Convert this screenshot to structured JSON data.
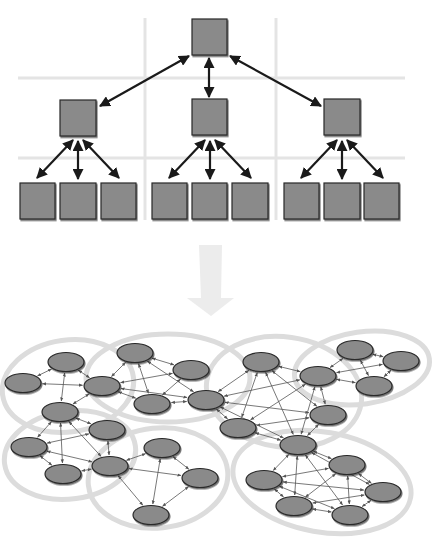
{
  "diagram": {
    "title": "",
    "colors": {
      "background": "#ffffff",
      "grid": "#e4e4e4",
      "node_fill": "#8a8a8a",
      "node_stroke": "#2a2a2a",
      "edge": "#1a1a1a",
      "thin_edge": "#555555",
      "cluster_outline": "#dcdcdc",
      "transition_arrow": "#ececec"
    },
    "hierarchy": {
      "grid": {
        "horizontal": [
          {
            "y": 78,
            "x1": 18,
            "x2": 405
          },
          {
            "y": 158,
            "x1": 18,
            "x2": 405
          }
        ],
        "vertical": [
          {
            "x": 145,
            "y1": 18,
            "y2": 220
          },
          {
            "x": 276,
            "y1": 18,
            "y2": 220
          }
        ]
      },
      "nodes": [
        {
          "id": "root",
          "x": 192,
          "y": 19,
          "w": 35,
          "h": 36
        },
        {
          "id": "mid-left",
          "x": 60,
          "y": 100,
          "w": 36,
          "h": 36
        },
        {
          "id": "mid-center",
          "x": 192,
          "y": 99,
          "w": 35,
          "h": 36
        },
        {
          "id": "mid-right",
          "x": 324,
          "y": 99,
          "w": 36,
          "h": 36
        },
        {
          "id": "leaf-1",
          "x": 20,
          "y": 183,
          "w": 35,
          "h": 36
        },
        {
          "id": "leaf-2",
          "x": 60,
          "y": 183,
          "w": 36,
          "h": 36
        },
        {
          "id": "leaf-3",
          "x": 101,
          "y": 183,
          "w": 35,
          "h": 36
        },
        {
          "id": "leaf-4",
          "x": 152,
          "y": 183,
          "w": 35,
          "h": 36
        },
        {
          "id": "leaf-5",
          "x": 192,
          "y": 183,
          "w": 35,
          "h": 36
        },
        {
          "id": "leaf-6",
          "x": 232,
          "y": 183,
          "w": 36,
          "h": 36
        },
        {
          "id": "leaf-7",
          "x": 284,
          "y": 183,
          "w": 35,
          "h": 36
        },
        {
          "id": "leaf-8",
          "x": 324,
          "y": 183,
          "w": 36,
          "h": 36
        },
        {
          "id": "leaf-9",
          "x": 364,
          "y": 183,
          "w": 35,
          "h": 36
        }
      ],
      "edges": [
        {
          "from": [
            189,
            56
          ],
          "to": [
            100,
            106
          ]
        },
        {
          "from": [
            209,
            58
          ],
          "to": [
            209,
            97
          ]
        },
        {
          "from": [
            230,
            56
          ],
          "to": [
            321,
            106
          ]
        },
        {
          "from": [
            73,
            140
          ],
          "to": [
            37,
            178
          ]
        },
        {
          "from": [
            78,
            141
          ],
          "to": [
            78,
            179
          ]
        },
        {
          "from": [
            83,
            140
          ],
          "to": [
            119,
            178
          ]
        },
        {
          "from": [
            205,
            140
          ],
          "to": [
            169,
            178
          ]
        },
        {
          "from": [
            210,
            141
          ],
          "to": [
            210,
            179
          ]
        },
        {
          "from": [
            215,
            140
          ],
          "to": [
            251,
            178
          ]
        },
        {
          "from": [
            337,
            140
          ],
          "to": [
            301,
            178
          ]
        },
        {
          "from": [
            342,
            141
          ],
          "to": [
            342,
            179
          ]
        },
        {
          "from": [
            347,
            140
          ],
          "to": [
            383,
            178
          ]
        }
      ]
    },
    "transition_arrow": {
      "points": "199,245 222,245 221,298 234,298 211,316 187,298 201,298",
      "direction": "down"
    },
    "network": {
      "clusters": [
        {
          "id": "cluster-top-left",
          "cx": 68,
          "cy": 386,
          "rx": 66,
          "ry": 46,
          "rot": -8
        },
        {
          "id": "cluster-top-center",
          "cx": 168,
          "cy": 378,
          "rx": 82,
          "ry": 44,
          "rot": 0
        },
        {
          "id": "cluster-left",
          "cx": 70,
          "cy": 455,
          "rx": 66,
          "ry": 44,
          "rot": -8
        },
        {
          "id": "cluster-bottom-center",
          "cx": 158,
          "cy": 478,
          "rx": 70,
          "ry": 50,
          "rot": -6
        },
        {
          "id": "cluster-center-mesh",
          "cx": 284,
          "cy": 392,
          "rx": 78,
          "ry": 55,
          "rot": 8
        },
        {
          "id": "cluster-top-right",
          "cx": 362,
          "cy": 368,
          "rx": 68,
          "ry": 36,
          "rot": -8
        },
        {
          "id": "cluster-bottom-right",
          "cx": 322,
          "cy": 482,
          "rx": 90,
          "ry": 50,
          "rot": 10
        }
      ],
      "nodes": [
        {
          "id": "A",
          "cx": 66,
          "cy": 362
        },
        {
          "id": "B",
          "cx": 23,
          "cy": 383
        },
        {
          "id": "C",
          "cx": 102,
          "cy": 386
        },
        {
          "id": "D",
          "cx": 60,
          "cy": 412
        },
        {
          "id": "E",
          "cx": 135,
          "cy": 353
        },
        {
          "id": "F",
          "cx": 191,
          "cy": 370
        },
        {
          "id": "G",
          "cx": 152,
          "cy": 404
        },
        {
          "id": "H",
          "cx": 206,
          "cy": 400
        },
        {
          "id": "I",
          "cx": 107,
          "cy": 430
        },
        {
          "id": "J",
          "cx": 29,
          "cy": 447
        },
        {
          "id": "K",
          "cx": 63,
          "cy": 474
        },
        {
          "id": "L",
          "cx": 110,
          "cy": 466
        },
        {
          "id": "M",
          "cx": 162,
          "cy": 448
        },
        {
          "id": "N",
          "cx": 200,
          "cy": 478
        },
        {
          "id": "O",
          "cx": 151,
          "cy": 515
        },
        {
          "id": "P",
          "cx": 261,
          "cy": 362
        },
        {
          "id": "Q",
          "cx": 318,
          "cy": 376
        },
        {
          "id": "R",
          "cx": 355,
          "cy": 350
        },
        {
          "id": "S",
          "cx": 401,
          "cy": 361
        },
        {
          "id": "T",
          "cx": 374,
          "cy": 386
        },
        {
          "id": "U",
          "cx": 328,
          "cy": 415
        },
        {
          "id": "V",
          "cx": 238,
          "cy": 428
        },
        {
          "id": "W",
          "cx": 298,
          "cy": 445
        },
        {
          "id": "X",
          "cx": 347,
          "cy": 465
        },
        {
          "id": "Y",
          "cx": 264,
          "cy": 480
        },
        {
          "id": "Z",
          "cx": 383,
          "cy": 492
        },
        {
          "id": "AA",
          "cx": 294,
          "cy": 506
        },
        {
          "id": "AB",
          "cx": 350,
          "cy": 515
        }
      ],
      "links": [
        [
          "A",
          "B"
        ],
        [
          "A",
          "C"
        ],
        [
          "A",
          "D"
        ],
        [
          "B",
          "C"
        ],
        [
          "C",
          "D"
        ],
        [
          "C",
          "E"
        ],
        [
          "C",
          "F"
        ],
        [
          "C",
          "H"
        ],
        [
          "E",
          "F"
        ],
        [
          "E",
          "G"
        ],
        [
          "E",
          "H"
        ],
        [
          "F",
          "G"
        ],
        [
          "G",
          "H"
        ],
        [
          "C",
          "G"
        ],
        [
          "D",
          "I"
        ],
        [
          "D",
          "J"
        ],
        [
          "D",
          "K"
        ],
        [
          "D",
          "L"
        ],
        [
          "I",
          "J"
        ],
        [
          "I",
          "L"
        ],
        [
          "J",
          "K"
        ],
        [
          "J",
          "L"
        ],
        [
          "K",
          "L"
        ],
        [
          "L",
          "M"
        ],
        [
          "L",
          "N"
        ],
        [
          "L",
          "O"
        ],
        [
          "M",
          "N"
        ],
        [
          "M",
          "O"
        ],
        [
          "N",
          "O"
        ],
        [
          "H",
          "P"
        ],
        [
          "H",
          "Q"
        ],
        [
          "H",
          "U"
        ],
        [
          "H",
          "V"
        ],
        [
          "H",
          "W"
        ],
        [
          "P",
          "Q"
        ],
        [
          "P",
          "U"
        ],
        [
          "P",
          "V"
        ],
        [
          "P",
          "W"
        ],
        [
          "Q",
          "U"
        ],
        [
          "Q",
          "V"
        ],
        [
          "Q",
          "W"
        ],
        [
          "U",
          "V"
        ],
        [
          "U",
          "W"
        ],
        [
          "V",
          "W"
        ],
        [
          "Q",
          "R"
        ],
        [
          "Q",
          "T"
        ],
        [
          "R",
          "S"
        ],
        [
          "R",
          "T"
        ],
        [
          "S",
          "T"
        ],
        [
          "Q",
          "S"
        ],
        [
          "W",
          "X"
        ],
        [
          "W",
          "Y"
        ],
        [
          "W",
          "Z"
        ],
        [
          "W",
          "AA"
        ],
        [
          "W",
          "AB"
        ],
        [
          "X",
          "Y"
        ],
        [
          "X",
          "Z"
        ],
        [
          "X",
          "AA"
        ],
        [
          "X",
          "AB"
        ],
        [
          "Y",
          "Z"
        ],
        [
          "Y",
          "AA"
        ],
        [
          "Y",
          "AB"
        ],
        [
          "Z",
          "AA"
        ],
        [
          "Z",
          "AB"
        ],
        [
          "AA",
          "AB"
        ]
      ]
    }
  }
}
